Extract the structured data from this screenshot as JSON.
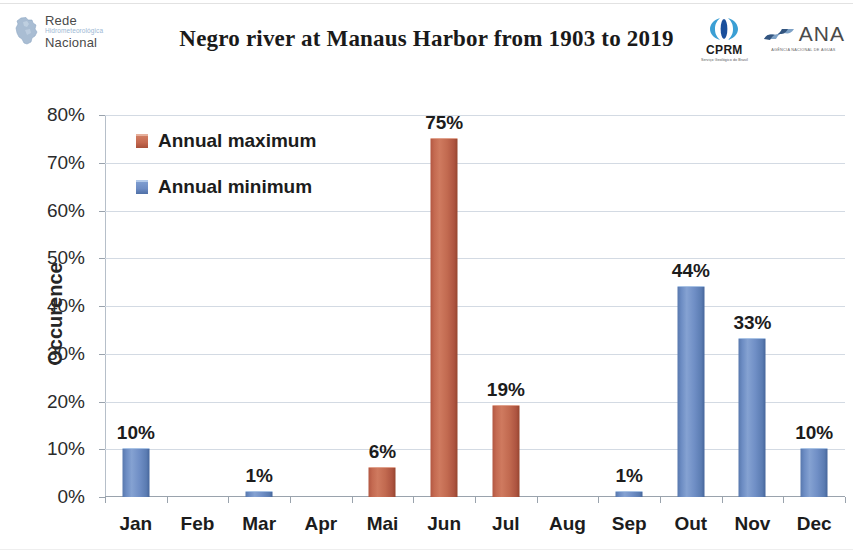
{
  "header": {
    "logo_left": {
      "icon": "brazil-map-icon",
      "line1": "Rede",
      "line2": "Hidrometeorológica",
      "line3": "Nacional"
    },
    "title": "Negro river at Manaus Harbor from 1903 to 2019",
    "logo_cprm": {
      "icon": "cprm-bracket-icon",
      "name": "CPRM",
      "subtitle": "Serviço Geológico do Brasil"
    },
    "logo_ana": {
      "icon": "ana-wave-icon",
      "name": "ANA",
      "subtitle": "AGÊNCIA NACIONAL DE ÁGUAS"
    }
  },
  "colors": {
    "annual_maximum": "#c46a51",
    "annual_minimum": "#6c8cc3",
    "gridline": "#d3dae3",
    "axis": "#9aa3ad",
    "text": "#1c1c1c"
  },
  "chart_data": {
    "type": "bar",
    "title": "Negro river at Manaus Harbor from 1903 to 2019",
    "xlabel": "",
    "ylabel": "Occurence",
    "categories": [
      "Jan",
      "Feb",
      "Mar",
      "Apr",
      "Mai",
      "Jun",
      "Jul",
      "Aug",
      "Sep",
      "Out",
      "Nov",
      "Dec"
    ],
    "ylim": [
      0,
      80
    ],
    "yticks": [
      0,
      10,
      20,
      30,
      40,
      50,
      60,
      70,
      80
    ],
    "ytick_labels": [
      "0%",
      "10%",
      "20%",
      "30%",
      "40%",
      "50%",
      "60%",
      "70%",
      "80%"
    ],
    "grid": true,
    "legend_position": "top-left",
    "series": [
      {
        "name": "Annual maximum",
        "color": "#c46a51",
        "values": [
          null,
          null,
          null,
          null,
          6,
          75,
          19,
          null,
          null,
          null,
          null,
          null
        ],
        "data_labels": [
          "",
          "",
          "",
          "",
          "6%",
          "75%",
          "19%",
          "",
          "",
          "",
          "",
          ""
        ]
      },
      {
        "name": "Annual minimum",
        "color": "#6c8cc3",
        "values": [
          10,
          null,
          1,
          null,
          null,
          null,
          null,
          null,
          1,
          44,
          33,
          10
        ],
        "data_labels": [
          "10%",
          "",
          "1%",
          "",
          "",
          "",
          "",
          "",
          "1%",
          "44%",
          "33%",
          "10%"
        ]
      }
    ]
  },
  "legend": {
    "items": [
      {
        "label": "Annual maximum",
        "kind": "max"
      },
      {
        "label": "Annual minimum",
        "kind": "min"
      }
    ]
  }
}
